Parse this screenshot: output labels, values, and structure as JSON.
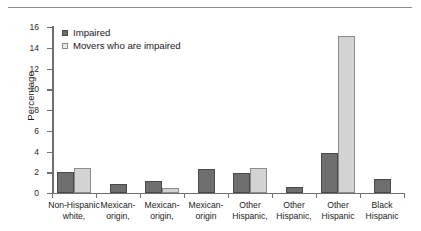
{
  "chart_data": {
    "type": "bar",
    "title": "",
    "subtitle": "",
    "xlabel": "",
    "ylabel": "Percentage",
    "ylim": [
      0,
      16
    ],
    "yticks": [
      0,
      2,
      4,
      6,
      8,
      10,
      12,
      14,
      16
    ],
    "grid": false,
    "legend_position": "top-left",
    "categories": [
      "Non-Hispanic white,",
      "Mexican-origin,",
      "Mexican-origin,",
      "Mexican-origin",
      "Other Hispanic,",
      "Other Hispanic,",
      "Other Hispanic",
      "Black Hispanic"
    ],
    "category_lines": [
      [
        "Non-Hispanic",
        "white,"
      ],
      [
        "Mexican-",
        "origin,"
      ],
      [
        "Mexican-",
        "origin,"
      ],
      [
        "Mexican-",
        "origin"
      ],
      [
        "Other",
        "Hispanic,"
      ],
      [
        "Other",
        "Hispanic,"
      ],
      [
        "Other",
        "Hispanic"
      ],
      [
        "Black",
        "Hispanic"
      ]
    ],
    "series": [
      {
        "name": "Impaired",
        "color": "#6e6e6e",
        "values": [
          2.0,
          0.9,
          1.2,
          2.3,
          1.9,
          0.55,
          3.9,
          1.35
        ]
      },
      {
        "name": "Movers who are impaired",
        "color": "#d3d3d3",
        "values": [
          2.4,
          null,
          0.45,
          null,
          2.45,
          null,
          15.1,
          null
        ]
      }
    ]
  },
  "colors": {
    "series_impaired": "#6e6e6e",
    "series_movers": "#d3d3d3",
    "axis": "#6f6f6f",
    "rule": "#8e8e8e",
    "text": "#1a1a1a",
    "background": "#ffffff"
  }
}
